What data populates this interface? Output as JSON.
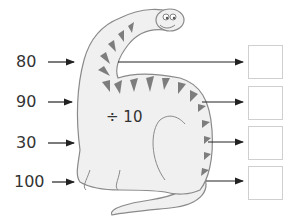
{
  "machine": {
    "operation": "÷ 10",
    "character": "dinosaur-function-machine"
  },
  "inputs": [
    {
      "value": "80"
    },
    {
      "value": "90"
    },
    {
      "value": "30"
    },
    {
      "value": "100"
    }
  ],
  "outputs": [
    {
      "value": ""
    },
    {
      "value": ""
    },
    {
      "value": ""
    },
    {
      "value": ""
    }
  ],
  "colors": {
    "dino_fill": "#f0f0f0",
    "dino_outline": "#8a8a8a",
    "stripes": "#7d7d7d",
    "arrow": "#222222",
    "box_border": "#cfcfcf"
  }
}
